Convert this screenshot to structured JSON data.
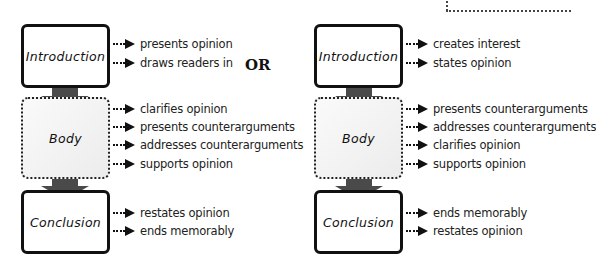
{
  "separator": {
    "label": "OR"
  },
  "left_diagram": {
    "introduction": {
      "title": "Introduction",
      "items": [
        "presents opinion",
        "draws readers in"
      ]
    },
    "body": {
      "title": "Body",
      "items": [
        "clarifies opinion",
        "presents counterarguments",
        "addresses counterarguments",
        "supports opinion"
      ]
    },
    "conclusion": {
      "title": "Conclusion",
      "items": [
        "restates opinion",
        "ends memorably"
      ]
    }
  },
  "right_diagram": {
    "introduction": {
      "title": "Introduction",
      "items": [
        "creates interest",
        "states opinion"
      ]
    },
    "body": {
      "title": "Body",
      "items": [
        "presents counterarguments",
        "addresses counterarguments",
        "clarifies opinion",
        "supports opinion"
      ]
    },
    "conclusion": {
      "title": "Conclusion",
      "items": [
        "ends memorably",
        "restates opinion"
      ]
    }
  },
  "colors": {
    "box_border": "#111111",
    "arrow": "#4a4a4a",
    "body_fill": "#f0f0f0",
    "text": "#222222"
  }
}
